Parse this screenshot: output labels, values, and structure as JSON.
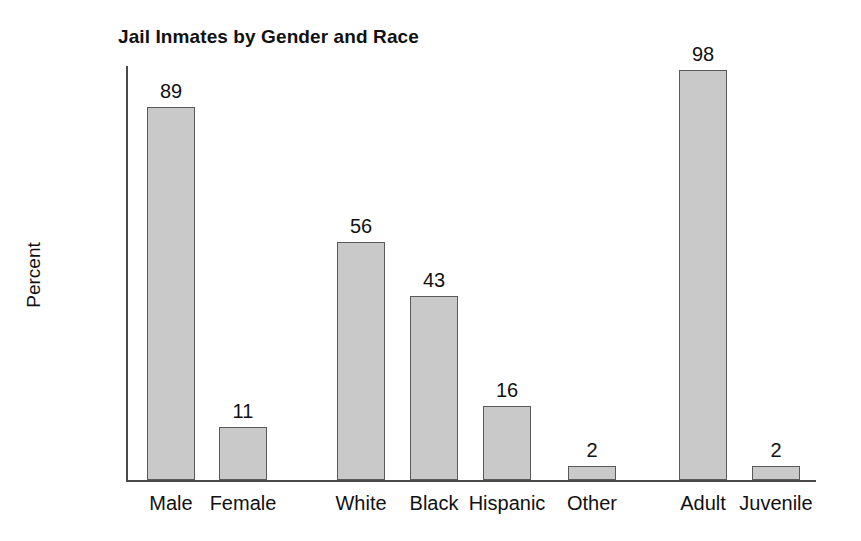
{
  "chart_data": {
    "type": "bar",
    "title": "Jail Inmates by Gender and Race",
    "xlabel": "",
    "ylabel": "Percent",
    "ylim": [
      0,
      100
    ],
    "yticks": [
      0,
      10,
      20,
      30,
      40,
      50,
      60,
      70,
      80,
      90,
      100
    ],
    "grid": false,
    "legend": "none",
    "categories": [
      "Male",
      "Female",
      "White",
      "Black",
      "Hispanic",
      "Other",
      "Adult",
      "Juvenile"
    ],
    "values": [
      89,
      11,
      56,
      43,
      16,
      2,
      98,
      2
    ],
    "groups": [
      {
        "name": "Gender",
        "categories": [
          "Male",
          "Female"
        ]
      },
      {
        "name": "Race",
        "categories": [
          "White",
          "Black",
          "Hispanic",
          "Other"
        ]
      },
      {
        "name": "Age",
        "categories": [
          "Adult",
          "Juvenile"
        ]
      }
    ],
    "bars": [
      {
        "category": "Male",
        "value": 89,
        "label": "89",
        "drawn": 91,
        "x": 147,
        "width": 48
      },
      {
        "category": "Female",
        "value": 11,
        "label": "11",
        "drawn": 13,
        "x": 219,
        "width": 48
      },
      {
        "category": "White",
        "value": 56,
        "label": "56",
        "drawn": 58,
        "x": 337,
        "width": 48
      },
      {
        "category": "Black",
        "value": 43,
        "label": "43",
        "drawn": 45,
        "x": 410,
        "width": 48
      },
      {
        "category": "Hispanic",
        "value": 16,
        "label": "16",
        "drawn": 18,
        "x": 483,
        "width": 48
      },
      {
        "category": "Other",
        "value": 2,
        "label": "2",
        "drawn": 3.5,
        "x": 568,
        "width": 48
      },
      {
        "category": "Adult",
        "value": 98,
        "label": "98",
        "drawn": 100,
        "x": 679,
        "width": 48
      },
      {
        "category": "Juvenile",
        "value": 2,
        "label": "2",
        "drawn": 3.5,
        "x": 752,
        "width": 48
      }
    ]
  },
  "colors": {
    "bar_fill": "#c9c9c9",
    "bar_border": "#5a5a5a",
    "axis": "#4a4a4a",
    "text": "#111111",
    "background": "#ffffff"
  }
}
